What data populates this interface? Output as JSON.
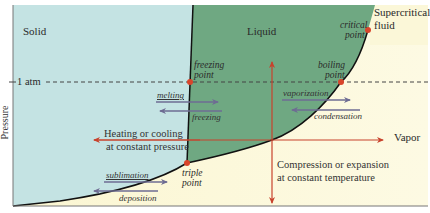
{
  "diagram": {
    "axis": {
      "ylabel": "Pressure",
      "pressure_marker": "1 atm"
    },
    "regions": {
      "solid": "Solid",
      "liquid": "Liquid",
      "vapor": "Vapor",
      "supercritical_line1": "Supercritical",
      "supercritical_line2": "fluid"
    },
    "points": {
      "freezing_line1": "freezing",
      "freezing_line2": "point",
      "boiling_line1": "boiling",
      "boiling_line2": "point",
      "critical_line1": "critical",
      "critical_line2": "point",
      "triple_line1": "triple",
      "triple_line2": "point"
    },
    "processes": {
      "melting": "melting",
      "freezing": "freezing",
      "vaporization": "vaporization",
      "condensation": "condensation",
      "sublimation": "sublimation",
      "deposition": "deposition"
    },
    "annotations": {
      "isobaric_line1": "Heating or cooling",
      "isobaric_line2": "at constant pressure",
      "isothermal_line1": "Compression or expansion",
      "isothermal_line2": "at constant temperature"
    },
    "colors": {
      "solid_fill": "#c4e3e3",
      "liquid_fill": "#6fa882",
      "vapor_fill": "#fbf7d6",
      "boundary": "#111111",
      "point": "#d9452b",
      "process_arrow": "#6e6c93",
      "red_arrow": "#c8422c",
      "dashed": "#444444"
    }
  }
}
